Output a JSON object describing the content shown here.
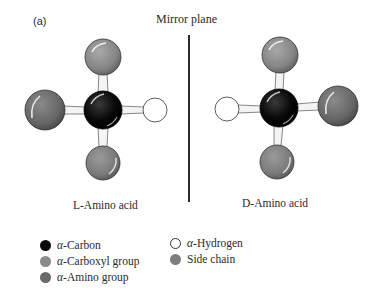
{
  "figure": {
    "panel_label": "(a)",
    "title": "Mirror plane",
    "colors": {
      "carbon": "#0a0a0a",
      "carboxyl": "#8a8a8a",
      "amino": "#6a6a6a",
      "hydrogen": "#ffffff",
      "side_chain": "#7e7e7e",
      "mirror_line": "#2b2b2b"
    },
    "molecules": [
      {
        "id": "l-amino-acid",
        "caption_prefix": "L",
        "caption_suffix": "-Amino acid",
        "center": [
          103,
          110
        ],
        "atoms": [
          {
            "role": "carboxyl",
            "position": "top"
          },
          {
            "role": "amino",
            "position": "left"
          },
          {
            "role": "hydrogen",
            "position": "right"
          },
          {
            "role": "side_chain",
            "position": "bottom"
          }
        ]
      },
      {
        "id": "d-amino-acid",
        "caption_prefix": "D",
        "caption_suffix": "-Amino acid",
        "center": [
          279,
          108
        ],
        "atoms": [
          {
            "role": "carboxyl",
            "position": "top"
          },
          {
            "role": "hydrogen",
            "position": "left"
          },
          {
            "role": "amino",
            "position": "right"
          },
          {
            "role": "side_chain",
            "position": "bottom"
          }
        ]
      }
    ],
    "legend": [
      {
        "symbol": "α",
        "label": "-Carbon",
        "color": "#0a0a0a",
        "outline": false
      },
      {
        "symbol": "α",
        "label": "-Carboxyl group",
        "color": "#8a8a8a",
        "outline": false
      },
      {
        "symbol": "α",
        "label": "-Amino group",
        "color": "#6a6a6a",
        "outline": false
      },
      {
        "symbol": "α",
        "label": "-Hydrogen",
        "color": "#ffffff",
        "outline": true
      },
      {
        "symbol": "",
        "label": "Side chain",
        "color": "#7e7e7e",
        "outline": false
      }
    ]
  }
}
